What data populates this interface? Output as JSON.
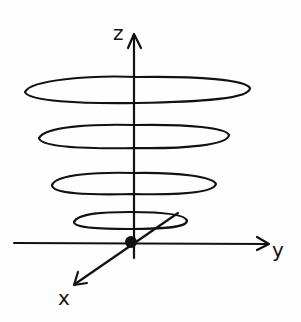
{
  "diagram": {
    "type": "hand-drawn 3D axes with stacked horizontal loops (helix/coil about z-axis)",
    "axes": {
      "z": {
        "label": "z"
      },
      "y": {
        "label": "y"
      },
      "x": {
        "label": "x"
      }
    },
    "origin": {
      "marker": "filled-dot"
    },
    "loops": [
      {
        "name": "loop-1-top",
        "cx": 137,
        "cy": 90,
        "rx": 112,
        "ry": 13
      },
      {
        "name": "loop-2",
        "cx": 133,
        "cy": 136,
        "rx": 95,
        "ry": 12
      },
      {
        "name": "loop-3",
        "cx": 133,
        "cy": 184,
        "rx": 82,
        "ry": 11
      },
      {
        "name": "loop-4-bottom",
        "cx": 130,
        "cy": 220,
        "rx": 57,
        "ry": 8
      }
    ],
    "colors": {
      "ink": "#111111",
      "paper": "#fefefe"
    }
  }
}
